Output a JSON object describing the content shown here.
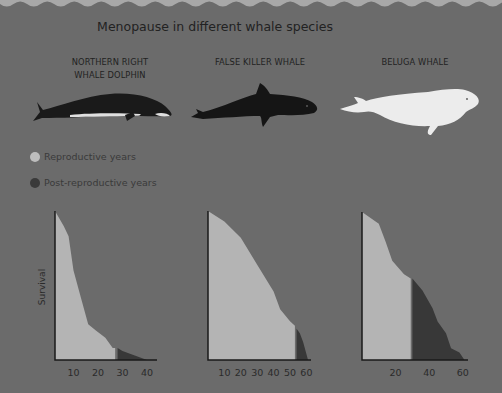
{
  "title": "Menopause in different whale species",
  "colors": {
    "background": "#6b6b6b",
    "reproductive": "#b4b4b4",
    "post_reproductive": "#383838",
    "wave": "#a8a8a8"
  },
  "legend": {
    "reproductive": "Reproductive years",
    "post_reproductive": "Post-reproductive years"
  },
  "y_axis_label": "Survival",
  "species": [
    {
      "name_line1": "NORTHERN RIGHT",
      "name_line2": "WHALE DOLPHIN"
    },
    {
      "name_line1": "FALSE KILLER WHALE",
      "name_line2": ""
    },
    {
      "name_line1": "BELUGA WHALE",
      "name_line2": ""
    }
  ],
  "chart_data": [
    {
      "type": "area",
      "title": "NORTHERN RIGHT WHALE DOLPHIN",
      "xlabel": "Age (years)",
      "ylabel": "Survival",
      "x_ticks": [
        10,
        20,
        30,
        40
      ],
      "xlim": [
        0,
        42
      ],
      "ylim": [
        0,
        1
      ],
      "grid": false,
      "series": [
        {
          "name": "Reproductive years",
          "x": [
            1,
            6,
            8,
            10,
            13,
            16,
            19,
            23,
            26,
            27
          ],
          "y": [
            1.0,
            0.9,
            0.83,
            0.6,
            0.42,
            0.24,
            0.2,
            0.15,
            0.08,
            0.08
          ]
        },
        {
          "name": "Post-reproductive years",
          "x": [
            28,
            30,
            35,
            40
          ],
          "y": [
            0.08,
            0.06,
            0.03,
            0.0
          ]
        }
      ]
    },
    {
      "type": "area",
      "title": "FALSE KILLER WHALE",
      "xlabel": "Age (years)",
      "ylabel": "Survival",
      "x_ticks": [
        10,
        20,
        30,
        40,
        50,
        60
      ],
      "xlim": [
        0,
        63
      ],
      "ylim": [
        0,
        1
      ],
      "grid": false,
      "series": [
        {
          "name": "Reproductive years",
          "x": [
            1,
            10,
            20,
            30,
            40,
            44,
            50,
            53
          ],
          "y": [
            1.0,
            0.93,
            0.82,
            0.64,
            0.46,
            0.34,
            0.26,
            0.23
          ]
        },
        {
          "name": "Post-reproductive years",
          "x": [
            54,
            56,
            58,
            60,
            61
          ],
          "y": [
            0.21,
            0.18,
            0.12,
            0.04,
            0.0
          ]
        }
      ]
    },
    {
      "type": "area",
      "title": "BELUGA WHALE",
      "xlabel": "Age (years)",
      "ylabel": "Survival",
      "x_ticks": [
        20,
        40,
        60
      ],
      "xlim": [
        0,
        63
      ],
      "ylim": [
        0,
        1
      ],
      "grid": false,
      "series": [
        {
          "name": "Reproductive years",
          "x": [
            1,
            10,
            14,
            18,
            25,
            29
          ],
          "y": [
            1.0,
            0.92,
            0.8,
            0.67,
            0.58,
            0.55
          ]
        },
        {
          "name": "Post-reproductive years",
          "x": [
            30,
            36,
            42,
            45,
            50,
            53,
            58,
            61
          ],
          "y": [
            0.55,
            0.47,
            0.35,
            0.26,
            0.18,
            0.08,
            0.05,
            0.0
          ]
        }
      ]
    }
  ]
}
